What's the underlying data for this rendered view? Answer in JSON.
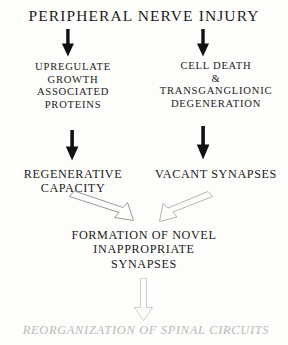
{
  "figure": {
    "title": "PERIPHERAL NERVE INJURY",
    "background_color": "#fdfdfb",
    "text_color": "#1b1b1b",
    "faded_color": "#b9b9b9"
  },
  "nodes": {
    "injury": "PERIPHERAL NERVE INJURY",
    "upregulate": "UPREGULATE\nGROWTH\nASSOCIATED\nPROTEINS",
    "cell_death": "CELL DEATH\n&\nTRANSGANGLIONIC\nDEGENERATION",
    "regenerative": "REGENERATIVE\nCAPACITY",
    "vacant": "VACANT SYNAPSES",
    "formation": "FORMATION OF NOVEL\nINAPPROPRIATE\nSYNAPSES",
    "reorganization": "REORGANIZATION OF SPINAL CIRCUITS"
  },
  "arrows": [
    {
      "name": "injury-to-upregulate",
      "style": "solid-black",
      "from": "injury",
      "to": "upregulate"
    },
    {
      "name": "injury-to-cell-death",
      "style": "solid-black",
      "from": "injury",
      "to": "cell_death"
    },
    {
      "name": "upregulate-to-regenerative",
      "style": "solid-black",
      "from": "upregulate",
      "to": "regenerative"
    },
    {
      "name": "cell-death-to-vacant",
      "style": "solid-black",
      "from": "cell_death",
      "to": "vacant"
    },
    {
      "name": "regenerative-to-formation",
      "style": "hollow-outline",
      "from": "regenerative",
      "to": "formation"
    },
    {
      "name": "vacant-to-formation",
      "style": "hollow-outline",
      "from": "vacant",
      "to": "formation"
    },
    {
      "name": "formation-to-reorganization",
      "style": "hollow-outline-faded",
      "from": "formation",
      "to": "reorganization"
    }
  ]
}
